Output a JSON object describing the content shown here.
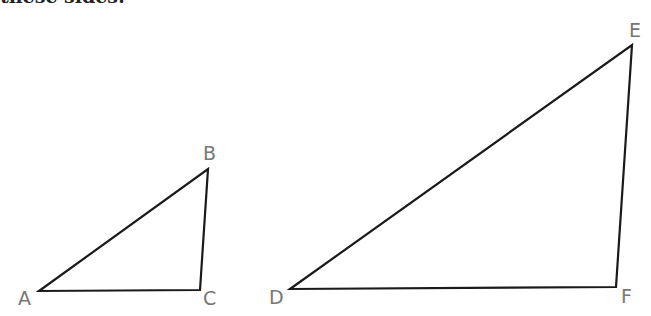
{
  "header": {
    "clipped_text": "these sides:"
  },
  "triangles": [
    {
      "name": "ABC",
      "vertices": [
        {
          "label": "A",
          "x": 39,
          "y": 291,
          "lx": 18,
          "ly": 305
        },
        {
          "label": "B",
          "x": 208,
          "y": 169,
          "lx": 203,
          "ly": 160
        },
        {
          "label": "C",
          "x": 200,
          "y": 290,
          "lx": 203,
          "ly": 305
        }
      ]
    },
    {
      "name": "DEF",
      "vertices": [
        {
          "label": "D",
          "x": 290,
          "y": 289,
          "lx": 269,
          "ly": 304
        },
        {
          "label": "E",
          "x": 632,
          "y": 45,
          "lx": 629,
          "ly": 37
        },
        {
          "label": "F",
          "x": 616,
          "y": 287,
          "lx": 621,
          "ly": 303
        }
      ]
    }
  ],
  "colors": {
    "stroke": "#1a1a1a",
    "label": "#777777"
  }
}
